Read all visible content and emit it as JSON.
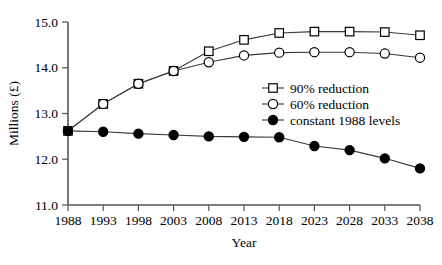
{
  "chart_data": {
    "type": "line",
    "title": "",
    "xlabel": "Year",
    "ylabel": "Millions (£)",
    "x": [
      1988,
      1993,
      1998,
      2003,
      2008,
      2013,
      2018,
      2023,
      2028,
      2033,
      2038
    ],
    "xticklabels": [
      "1988",
      "1993",
      "1998",
      "2003",
      "2008",
      "2013",
      "2018",
      "2023",
      "2028",
      "2033",
      "2038"
    ],
    "yticklabels": [
      "11.0",
      "12.0",
      "13.0",
      "14.0",
      "15.0"
    ],
    "yticks": [
      11.0,
      12.0,
      13.0,
      14.0,
      15.0
    ],
    "xlim": [
      1988,
      2038
    ],
    "ylim": [
      11.0,
      15.0
    ],
    "grid": false,
    "legend_position": "center-right",
    "series": [
      {
        "name": "90% reduction",
        "marker": "open-square",
        "values": [
          12.62,
          13.21,
          13.65,
          13.93,
          14.36,
          14.61,
          14.76,
          14.79,
          14.79,
          14.78,
          14.71
        ]
      },
      {
        "name": "60% reduction",
        "marker": "open-circle",
        "values": [
          12.62,
          13.21,
          13.65,
          13.93,
          14.12,
          14.27,
          14.33,
          14.34,
          14.34,
          14.31,
          14.22
        ]
      },
      {
        "name": "constant 1988 levels",
        "marker": "filled-circle",
        "values": [
          12.62,
          12.6,
          12.56,
          12.53,
          12.5,
          12.49,
          12.48,
          12.29,
          12.2,
          12.02,
          11.8
        ]
      }
    ]
  },
  "legend": {
    "items": [
      {
        "label": "90% reduction",
        "marker": "open-square"
      },
      {
        "label": "60% reduction",
        "marker": "open-circle"
      },
      {
        "label": "constant 1988 levels",
        "marker": "filled-circle"
      }
    ]
  }
}
